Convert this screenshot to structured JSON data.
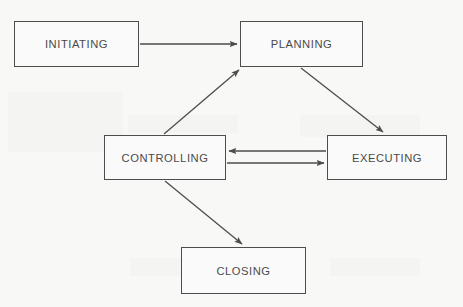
{
  "diagram": {
    "type": "flow-diagram",
    "background_color": "#f8f8f7",
    "stroke_color": "#4d4d4d",
    "text_color": "#4a4a4a",
    "nodes": [
      {
        "id": "initiating",
        "label": "INITIATING",
        "shape": "rectangle",
        "x": 14,
        "y": 21,
        "width": 125,
        "height": 46
      },
      {
        "id": "planning",
        "label": "PLANNING",
        "shape": "rectangle",
        "x": 240,
        "y": 21,
        "width": 123,
        "height": 46
      },
      {
        "id": "controlling",
        "label": "CONTROLLING",
        "shape": "rectangle",
        "x": 104,
        "y": 135,
        "width": 122,
        "height": 45
      },
      {
        "id": "executing",
        "label": "EXECUTING",
        "shape": "rectangle",
        "x": 327,
        "y": 135,
        "width": 120,
        "height": 45
      },
      {
        "id": "closing",
        "label": "CLOSING",
        "shape": "rectangle",
        "x": 181,
        "y": 247,
        "width": 125,
        "height": 47
      }
    ],
    "edges": [
      {
        "id": "initiating-to-planning",
        "from": "initiating",
        "to": "planning",
        "direction": "right",
        "x1": 140,
        "y1": 44,
        "x2": 238,
        "y2": 44
      },
      {
        "id": "planning-to-executing",
        "from": "planning",
        "to": "executing",
        "direction": "down-right",
        "x1": 301,
        "y1": 68,
        "x2": 384,
        "y2": 133
      },
      {
        "id": "controlling-to-planning",
        "from": "controlling",
        "to": "planning",
        "direction": "up-right",
        "x1": 164,
        "y1": 134,
        "x2": 240,
        "y2": 69
      },
      {
        "id": "executing-to-controlling",
        "from": "executing",
        "to": "controlling",
        "direction": "left",
        "x1": 326,
        "y1": 151,
        "x2": 228,
        "y2": 151
      },
      {
        "id": "controlling-to-executing",
        "from": "controlling",
        "to": "executing",
        "direction": "right",
        "x1": 227,
        "y1": 163,
        "x2": 325,
        "y2": 163
      },
      {
        "id": "controlling-to-closing",
        "from": "controlling",
        "to": "closing",
        "direction": "down-right",
        "x1": 165,
        "y1": 181,
        "x2": 243,
        "y2": 245
      }
    ]
  }
}
